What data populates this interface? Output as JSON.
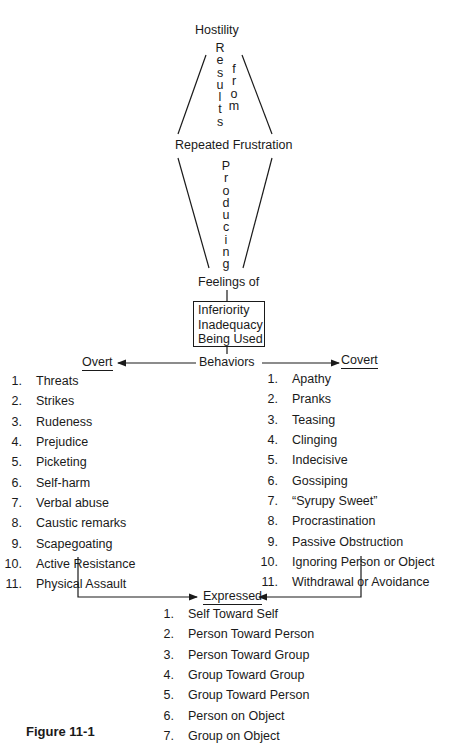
{
  "diagram": {
    "top_label": "Hostility",
    "connector1": {
      "left_word": "Results",
      "right_word": "from"
    },
    "middle_label": "Repeated Frustration",
    "connector2": {
      "word": "Producing"
    },
    "feelings_label": "Feelings of",
    "feelings_box": [
      "Inferiority",
      "Inadequacy",
      "Being Used"
    ],
    "behaviors_label": "Behaviors",
    "overt": {
      "title": "Overt",
      "items": [
        {
          "num": "1.",
          "label": "Threats"
        },
        {
          "num": "2.",
          "label": "Strikes"
        },
        {
          "num": "3.",
          "label": "Rudeness"
        },
        {
          "num": "4.",
          "label": "Prejudice"
        },
        {
          "num": "5.",
          "label": "Picketing"
        },
        {
          "num": "6.",
          "label": "Self-harm"
        },
        {
          "num": "7.",
          "label": "Verbal abuse"
        },
        {
          "num": "8.",
          "label": "Caustic remarks"
        },
        {
          "num": "9.",
          "label": "Scapegoating"
        },
        {
          "num": "10.",
          "label": "Active Resistance"
        },
        {
          "num": "11.",
          "label": "Physical Assault"
        }
      ]
    },
    "covert": {
      "title": "Covert",
      "items": [
        {
          "num": "1.",
          "label": "Apathy"
        },
        {
          "num": "2.",
          "label": "Pranks"
        },
        {
          "num": "3.",
          "label": "Teasing"
        },
        {
          "num": "4.",
          "label": "Clinging"
        },
        {
          "num": "5.",
          "label": "Indecisive"
        },
        {
          "num": "6.",
          "label": "Gossiping"
        },
        {
          "num": "7.",
          "label": "“Syrupy Sweet”"
        },
        {
          "num": "8.",
          "label": "Procrastination"
        },
        {
          "num": "9.",
          "label": "Passive Obstruction"
        },
        {
          "num": "10.",
          "label": "Ignoring Person or Object"
        },
        {
          "num": "11.",
          "label": "Withdrawal or Avoidance"
        }
      ]
    },
    "expressed": {
      "title": "Expressed",
      "items": [
        {
          "num": "1.",
          "label": "Self Toward Self"
        },
        {
          "num": "2.",
          "label": "Person Toward Person"
        },
        {
          "num": "3.",
          "label": "Person Toward Group"
        },
        {
          "num": "4.",
          "label": "Group Toward Group"
        },
        {
          "num": "5.",
          "label": "Group Toward Person"
        },
        {
          "num": "6.",
          "label": "Person on Object"
        },
        {
          "num": "7.",
          "label": "Group on Object"
        }
      ]
    },
    "caption": "Figure 11-1"
  }
}
